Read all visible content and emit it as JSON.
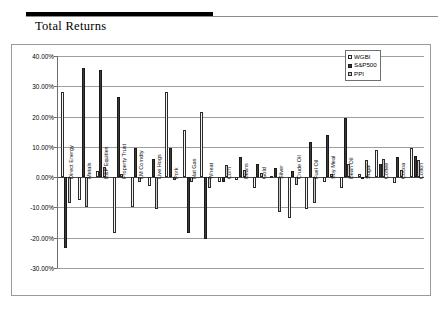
{
  "header": {
    "title": "Total Returns"
  },
  "legend": {
    "position": "top-right",
    "entries": [
      {
        "label": "WGBI",
        "color": "#f4f4f4"
      },
      {
        "label": "S&P500",
        "color": "#3a3a3a"
      },
      {
        "label": "PPI",
        "color": "#c9c9c9"
      }
    ]
  },
  "chart_data": {
    "type": "bar",
    "title": "Total Returns",
    "xlabel": "",
    "ylabel": "",
    "ylim": [
      -30,
      40
    ],
    "ytick_format": "0.00%",
    "ytick_labels": [
      "40.00%",
      "30.00%",
      "20.00%",
      "10.00%",
      "0.00%",
      "-10.00%",
      "-20.00%",
      "-30.00%"
    ],
    "ytick_values": [
      40,
      30,
      20,
      10,
      0,
      -10,
      -20,
      -30
    ],
    "grid": true,
    "categories": [
      "Direct Energy",
      "Metals",
      "E&P Equities",
      "Property Trust",
      "LM Comdty",
      "Live Hogs",
      "Pork",
      "Nat Gas",
      "Wheat",
      "Corn",
      "Beans",
      "Gold",
      "Silver",
      "Crude Oil",
      "Fuel Oil",
      "Soy Meal",
      "Bean Oil",
      "Sugar",
      "Coffee",
      "Cocoa",
      "Cotton"
    ],
    "series": [
      {
        "name": "WGBI",
        "color": "#f4f4f4",
        "values": [
          28.0,
          -7.5,
          2.0,
          -18.5,
          -10.0,
          -3.0,
          28.0,
          15.5,
          21.5,
          -1.5,
          -1.0,
          -3.5,
          0.5,
          -13.5,
          -10.5,
          -1.5,
          -3.5,
          1.0,
          9.0,
          -2.0,
          9.5
        ]
      },
      {
        "name": "S&P500",
        "color": "#3a3a3a",
        "values": [
          -23.5,
          36.0,
          35.5,
          26.5,
          9.5,
          6.0,
          9.5,
          -18.5,
          -20.5,
          -1.5,
          6.5,
          4.5,
          3.0,
          2.0,
          11.5,
          14.0,
          19.5,
          -0.5,
          4.5,
          6.5,
          7.0
        ]
      },
      {
        "name": "PPI",
        "color": "#c9c9c9",
        "values": [
          -8.5,
          -10.0,
          3.5,
          1.0,
          -1.5,
          -10.5,
          -1.0,
          -1.5,
          -3.5,
          4.0,
          2.5,
          1.5,
          -11.5,
          -2.5,
          -8.5,
          1.0,
          4.5,
          5.5,
          6.0,
          2.5,
          5.5
        ]
      }
    ]
  }
}
